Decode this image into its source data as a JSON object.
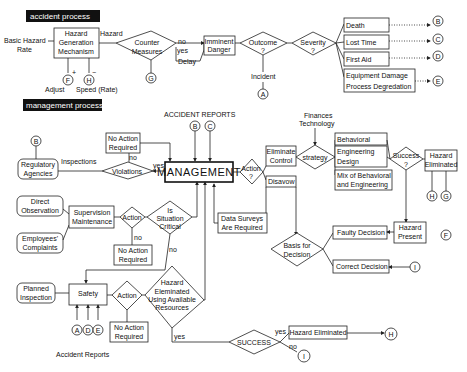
{
  "sections": {
    "accident_process": "accident process",
    "management_process": "management process"
  },
  "accident": {
    "basic_hazard_rate": [
      "Basic Hazard",
      "Rate"
    ],
    "hazard_generation": [
      "Hazard",
      "Generation",
      "Mechanism"
    ],
    "hazard_label": "Hazard",
    "counter_measures": [
      "Counter",
      "Measures"
    ],
    "no": "no",
    "yes": "yes",
    "delay": "Delay",
    "imminent_danger": [
      "Imminent",
      "Danger"
    ],
    "outcome": [
      "Outcome",
      "?"
    ],
    "severity": [
      "Severity",
      "?"
    ],
    "incident": "Incident",
    "adjust": "Adjust",
    "speed_rate": "Speed (Rate)",
    "plus": "+",
    "minus": "−",
    "outcomes": [
      "Death",
      "Lost Time",
      "First Aid"
    ],
    "equipment": [
      "Equipment Damage",
      "Process Degredation"
    ]
  },
  "connectors": {
    "A": "A",
    "B": "B",
    "C": "C",
    "D": "D",
    "E": "E",
    "F": "F",
    "G": "G",
    "H": "H",
    "I": "I"
  },
  "management": {
    "accident_reports_title": "ACCIDENT REPORTS",
    "management": "MANAGEMENT",
    "no_action_required": [
      "No Action",
      "Required"
    ],
    "regulatory_agencies": [
      "Regulatory",
      "Agencies"
    ],
    "inspections": "Inspections",
    "violations": "Violations",
    "no": "no",
    "yes": "yes",
    "direct_observation": [
      "Direct",
      "Observation"
    ],
    "employees_complaints": [
      "Employees'",
      "Complaints"
    ],
    "supervision_maintenance": [
      "Supervision",
      "Maintenance"
    ],
    "action": "Action",
    "is_situation_critical": [
      "Is",
      "Situation",
      "Critical"
    ],
    "planned_inspection": [
      "Planned",
      "Inspection"
    ],
    "safety": "Safety",
    "hazard_eliminated_using": [
      "Hazard",
      "Eleminated",
      "Using Available",
      "Resources"
    ],
    "accident_reports_bottom": "Accident Reports",
    "action_q": [
      "Action",
      "?"
    ],
    "eliminate_control": [
      "Eliminate",
      "Control"
    ],
    "disavow": "Disavow",
    "data_surveys": [
      "Data Surveys",
      "Are Required"
    ],
    "finances_technology": [
      "Finances",
      "Technology"
    ],
    "strategy": "strategy",
    "behavioral": "Behavioral",
    "engineering_design": [
      "Engineering",
      "Design"
    ],
    "mix": [
      "Mix of Behavioral",
      "and Engineering"
    ],
    "success_q": [
      "Success",
      "?"
    ],
    "hazard_eliminated": [
      "Hazard",
      "Eliminated"
    ],
    "basis_for_decision": [
      "Basis for",
      "Decision"
    ],
    "faulty_decision": "Faulty Decision",
    "correct_decision": "Correct Decision",
    "hazard_present": [
      "Hazard",
      "Present"
    ],
    "success": "SUCCESS",
    "hazard_eliminated_final": "Hazard Eliminated"
  }
}
